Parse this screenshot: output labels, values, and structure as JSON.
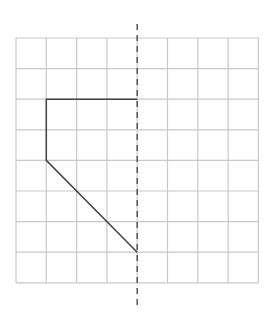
{
  "diagram": {
    "type": "symmetry-grid",
    "grid": {
      "columns": 8,
      "rows": 8,
      "origin_px": [
        16,
        38
      ],
      "cell_w_px": 30.3,
      "cell_h_px": 30.6,
      "line_color": "#c8c8c8",
      "line_width": 1.2
    },
    "symmetry_line": {
      "orientation": "vertical",
      "grid_column_index": 4,
      "y_top_px": 24,
      "y_bottom_px": 308,
      "style": "dashed",
      "color": "#555555",
      "width": 1.5,
      "dash": "6,5"
    },
    "shape": {
      "description": "Half of a figure on the left of the symmetry line; to be reflected",
      "vertices_grid": [
        [
          4,
          2
        ],
        [
          1,
          2
        ],
        [
          1,
          4
        ],
        [
          4,
          7
        ]
      ],
      "stroke_color": "#444444",
      "stroke_width": 1.5
    }
  }
}
